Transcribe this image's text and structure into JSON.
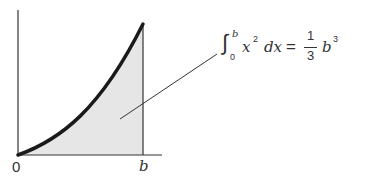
{
  "diagram": {
    "axis_labels": {
      "origin": "0",
      "x_end": "b"
    },
    "formula": {
      "integral_sign": "∫",
      "upper_limit": "b",
      "lower_limit": "0",
      "integrand_var": "x",
      "integrand_exp": "2",
      "differential": "dx",
      "equals": "=",
      "fraction_num": "1",
      "fraction_den": "3",
      "result_var": "b",
      "result_exp": "3"
    },
    "colors": {
      "curve": "#1a1a1a",
      "fill": "#e6e6e6",
      "axis": "#333333",
      "leader": "#333333"
    }
  }
}
